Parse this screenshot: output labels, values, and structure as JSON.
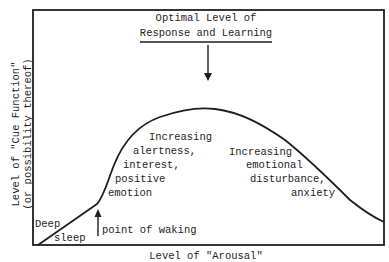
{
  "diagram": {
    "title_line1": "Optimal Level of",
    "title_line2": "Response and Learning",
    "y_axis_label_line1": "Level of \"Cue Function\"",
    "y_axis_label_line2": "(or possibility thereof)",
    "x_axis_label_clipped": "Level of \"Arousal\"",
    "annotations": {
      "deep": "Deep",
      "sleep": "sleep",
      "point_of_waking": "point of waking",
      "left_region": [
        "Increasing",
        "alertness,",
        "interest,",
        "positive",
        "emotion"
      ],
      "right_region": [
        "Increasing",
        "emotional",
        "disturbance,",
        "anxiety"
      ]
    },
    "colors": {
      "ink": "#1e1e1e",
      "background": "#ffffff"
    }
  }
}
